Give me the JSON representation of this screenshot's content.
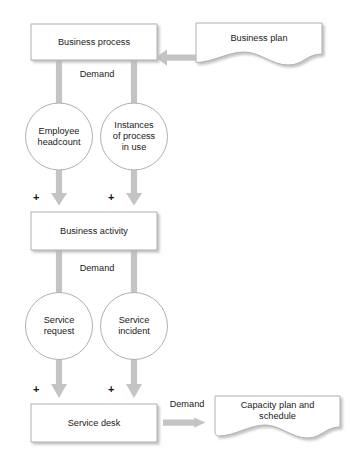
{
  "diagram": {
    "type": "flow-diagram",
    "colors": {
      "node_stroke": "#b0b0b0",
      "node_fill": "#ffffff",
      "arrow": "#c4c4c4",
      "shadow": "#d9d9d9",
      "text": "#1a1a1a"
    },
    "nodes": [
      {
        "id": "business-process",
        "shape": "rectangle",
        "label": "Business process"
      },
      {
        "id": "business-plan",
        "shape": "document",
        "label": "Business plan"
      },
      {
        "id": "employee-headcount",
        "shape": "circle",
        "label": "Employee\nheadcount"
      },
      {
        "id": "instances-of-process-in-use",
        "shape": "circle",
        "label": "Instances\nof process\nin use"
      },
      {
        "id": "business-activity",
        "shape": "rectangle",
        "label": "Business activity"
      },
      {
        "id": "service-request",
        "shape": "circle",
        "label": "Service\nrequest"
      },
      {
        "id": "service-incident",
        "shape": "circle",
        "label": "Service\nincident"
      },
      {
        "id": "service-desk",
        "shape": "rectangle",
        "label": "Service desk"
      },
      {
        "id": "capacity-plan-and-schedule",
        "shape": "document",
        "label": "Capacity plan and\nschedule"
      }
    ],
    "edge_labels": [
      {
        "id": "demand-top",
        "label": "Demand"
      },
      {
        "id": "demand-middle",
        "label": "Demand"
      },
      {
        "id": "demand-bottom",
        "label": "Demand"
      }
    ],
    "operators": [
      {
        "id": "plus-activity-left",
        "label": "+"
      },
      {
        "id": "plus-activity-right",
        "label": "+"
      },
      {
        "id": "plus-desk-left",
        "label": "+"
      },
      {
        "id": "plus-desk-right",
        "label": "+"
      }
    ]
  }
}
